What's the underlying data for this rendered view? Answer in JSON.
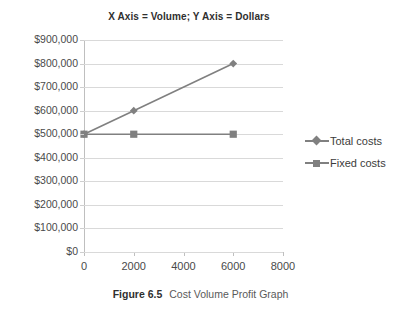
{
  "figure": {
    "caption_number": "Figure 6.5",
    "caption_text": "Cost Volume Profit Graph"
  },
  "chart_data": {
    "type": "line",
    "title": "X Axis =  Volume;  Y Axis = Dollars",
    "xlabel": "",
    "ylabel": "",
    "x": [
      0,
      2000,
      6000
    ],
    "xlim": [
      0,
      8000
    ],
    "ylim": [
      0,
      900000
    ],
    "xticks": [
      0,
      2000,
      4000,
      6000,
      8000
    ],
    "xtick_labels": [
      "0",
      "2000",
      "4000",
      "6000",
      "8000"
    ],
    "yticks": [
      0,
      100000,
      200000,
      300000,
      400000,
      500000,
      600000,
      700000,
      800000,
      900000
    ],
    "ytick_labels": [
      "$0",
      "$100,000",
      "$200,000",
      "$300,000",
      "$400,000",
      "$500,000",
      "$600,000",
      "$700,000",
      "$800,000",
      "$900,000"
    ],
    "grid": true,
    "grid_axis": "y",
    "legend_position": "right",
    "series": [
      {
        "name": "Total costs",
        "marker": "diamond",
        "color": "#808080",
        "x": [
          0,
          2000,
          6000
        ],
        "values": [
          500000,
          600000,
          800000
        ]
      },
      {
        "name": "Fixed costs",
        "marker": "square",
        "color": "#808080",
        "x": [
          0,
          2000,
          6000
        ],
        "values": [
          500000,
          500000,
          500000
        ]
      }
    ]
  },
  "legend": {
    "items": [
      {
        "label": "Total costs",
        "marker": "diamond"
      },
      {
        "label": "Fixed costs",
        "marker": "square"
      }
    ]
  },
  "colors": {
    "series": "#808080",
    "gridline": "#d9d9d9",
    "axis": "#bfbfbf",
    "text": "#3b3b3b",
    "background": "#ffffff"
  }
}
